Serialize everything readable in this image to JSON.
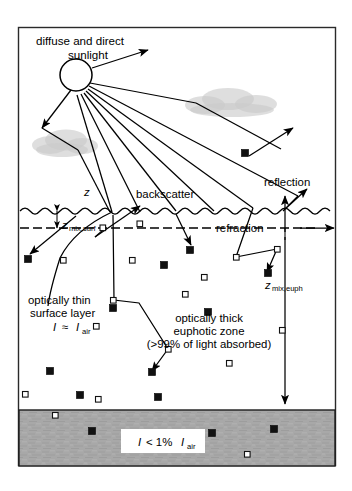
{
  "figure": {
    "domain": "diagram",
    "title_label": "diffuse and direct sunlight",
    "title_line1": "diffuse and direct",
    "title_line2": "sunlight",
    "frame": {
      "x": 18,
      "y": 27,
      "width": 318,
      "height": 439,
      "border_color": "#2a2a2a"
    }
  },
  "labels": {
    "sunlight_line1": "diffuse and direct",
    "sunlight_line2": "sunlight",
    "depth_z": "z",
    "backscatter": "backscatter",
    "reflection": "reflection",
    "refraction": "refraction",
    "z_mix_surf_main": "z",
    "z_mix_surf_sub": "mix,surf",
    "z_mix_euph_main": "z",
    "z_mix_euph_sub": "mix,euph",
    "thin_layer_line1": "optically thin",
    "thin_layer_line2": "surface layer",
    "thin_layer_eq_I": "I",
    "thin_layer_eq_approx": "≈",
    "thin_layer_eq_I2": "I",
    "thin_layer_eq_sub": "air",
    "thick_zone_line1": "optically thick",
    "thick_zone_line2": "euphotic zone",
    "thick_zone_line3": "(>99% of light absorbed)",
    "sediment_eq_I": "I",
    "sediment_eq_rel": "< 1%",
    "sediment_eq_I2": "I",
    "sediment_eq_sub": "air"
  },
  "colors": {
    "ink": "#000000",
    "frame": "#2a2a2a",
    "sediment_fill": "#a8a8a8",
    "cloud_fill": "#c9c9c9",
    "particle_filled": "#111111",
    "particle_open_fill": "#ffffff",
    "background": "#ffffff"
  },
  "geometry": {
    "sun": {
      "cx": 76,
      "cy": 75,
      "r": 16
    },
    "water_surface_y": 211,
    "mixed_layer_dashed_y": 228,
    "sediment_top_y": 410,
    "sediment_bottom_y": 466
  },
  "clouds": [
    {
      "cx": 62,
      "cy": 143,
      "rx": 34,
      "ry": 12
    },
    {
      "cx": 232,
      "cy": 102,
      "rx": 45,
      "ry": 13
    }
  ],
  "sunrays": [
    {
      "name": "upward-emitted-ray",
      "x1": 92,
      "y1": 68,
      "x2": 152,
      "y2": 50
    },
    {
      "name": "ray-to-cloud-right",
      "x1": 90,
      "y1": 82,
      "x2": 196,
      "y2": 100
    },
    {
      "name": "ray-long-right-1",
      "x1": 89,
      "y1": 85,
      "x2": 296,
      "y2": 157
    },
    {
      "name": "ray-long-right-2",
      "x1": 88,
      "y1": 88,
      "x2": 276,
      "y2": 196
    },
    {
      "name": "ray-mid-right-1",
      "x1": 87,
      "y1": 91,
      "x2": 232,
      "y2": 208
    },
    {
      "name": "ray-mid-right-2",
      "x1": 85,
      "y1": 93,
      "x2": 196,
      "y2": 211
    },
    {
      "name": "ray-mid-1",
      "x1": 83,
      "y1": 94,
      "x2": 160,
      "y2": 212
    },
    {
      "name": "ray-mid-2",
      "x1": 80,
      "y1": 95,
      "x2": 126,
      "y2": 211
    },
    {
      "name": "ray-down-left-1",
      "x1": 76,
      "y1": 95,
      "x2": 103,
      "y2": 212
    },
    {
      "name": "ray-down-left-2",
      "x1": 71,
      "y1": 93,
      "x2": 59,
      "y2": 145
    }
  ],
  "particles_filled": [
    {
      "x": 245,
      "y": 153
    },
    {
      "x": 190,
      "y": 250
    },
    {
      "x": 28,
      "y": 259
    },
    {
      "x": 164,
      "y": 265
    },
    {
      "x": 113,
      "y": 308
    },
    {
      "x": 270,
      "y": 277
    },
    {
      "x": 208,
      "y": 312
    },
    {
      "x": 145,
      "y": 375
    },
    {
      "x": 50,
      "y": 371
    },
    {
      "x": 80,
      "y": 419
    },
    {
      "x": 195,
      "y": 421
    },
    {
      "x": 253,
      "y": 429
    },
    {
      "x": 96,
      "y": 448
    },
    {
      "x": 221,
      "y": 447
    },
    {
      "x": 285,
      "y": 443
    }
  ],
  "particles_open": [
    {
      "x": 103,
      "y": 228
    },
    {
      "x": 140,
      "y": 224
    },
    {
      "x": 63,
      "y": 260
    },
    {
      "x": 132,
      "y": 260
    },
    {
      "x": 242,
      "y": 257
    },
    {
      "x": 277,
      "y": 250
    },
    {
      "x": 204,
      "y": 277
    },
    {
      "x": 185,
      "y": 294
    },
    {
      "x": 131,
      "y": 295
    },
    {
      "x": 96,
      "y": 326
    },
    {
      "x": 282,
      "y": 330
    },
    {
      "x": 178,
      "y": 333
    },
    {
      "x": 229,
      "y": 363
    },
    {
      "x": 25,
      "y": 394
    },
    {
      "x": 98,
      "y": 399
    },
    {
      "x": 171,
      "y": 360
    },
    {
      "x": 56,
      "y": 415
    },
    {
      "x": 247,
      "y": 455
    }
  ],
  "annotations": {
    "backscatter_target": "upward scattering arrow from subsurface to atmosphere",
    "reflection_target": "arrow reflecting off water surface upward right",
    "refraction_target": "ray bending at the water surface",
    "z_arrow": "vertical depth axis arrow at right side"
  }
}
